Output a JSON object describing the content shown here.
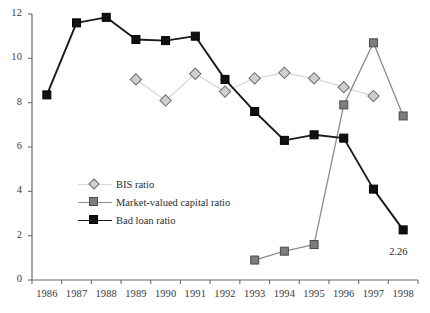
{
  "chart_data": {
    "type": "line",
    "title": "",
    "subtitle": "",
    "xlabel": "",
    "ylabel": "",
    "categories": [
      "1986",
      "1987",
      "1988",
      "1989",
      "1990",
      "1991",
      "1992",
      "1993",
      "1994",
      "1995",
      "1996",
      "1997",
      "1998"
    ],
    "x": [
      1986,
      1987,
      1988,
      1989,
      1990,
      1991,
      1992,
      1993,
      1994,
      1995,
      1996,
      1997,
      1998
    ],
    "xlim": [
      1985.5,
      1998.5
    ],
    "ylim": [
      0,
      12
    ],
    "yticks": [
      0,
      2,
      4,
      6,
      8,
      10,
      12
    ],
    "ytick_labels": [
      "0",
      "2",
      "4",
      "6",
      "8",
      "10",
      "12"
    ],
    "grid": false,
    "legend_position": "inside-lower-left",
    "series": [
      {
        "name": "BIS ratio",
        "color": "#d9d9d9",
        "marker": "diamond",
        "marker_fill": "#cfcfcf",
        "marker_edge": "#6e6e6e",
        "values": [
          null,
          null,
          null,
          9.05,
          8.1,
          9.3,
          8.5,
          9.1,
          9.35,
          9.1,
          8.7,
          8.3,
          null
        ]
      },
      {
        "name": "Market-valued capital ratio",
        "color": "#8c8c8c",
        "marker": "square",
        "marker_fill": "#7d7d7d",
        "marker_edge": "#4a4a4a",
        "values": [
          null,
          null,
          null,
          null,
          null,
          null,
          null,
          0.9,
          1.3,
          1.6,
          7.9,
          10.7,
          7.4
        ]
      },
      {
        "name": "Bad loan ratio",
        "color": "#1a1a1a",
        "marker": "square",
        "marker_fill": "#111111",
        "marker_edge": "#000000",
        "values": [
          8.35,
          11.6,
          11.85,
          10.85,
          10.8,
          11.0,
          9.05,
          7.6,
          6.3,
          6.55,
          6.4,
          4.1,
          2.26
        ]
      }
    ],
    "annotations": [
      {
        "text": "2.26",
        "x": 1998,
        "y": 2.26,
        "dx": 8,
        "dy": 16
      }
    ]
  },
  "legend": {
    "items": [
      {
        "label": "BIS ratio"
      },
      {
        "label": "Market-valued capital ratio"
      },
      {
        "label": "Bad loan ratio"
      }
    ]
  },
  "axes": {
    "y": {
      "labels": [
        "12",
        "10",
        "8",
        "6",
        "4",
        "2",
        "0"
      ]
    },
    "x": {
      "labels": [
        "1986",
        "1987",
        "1988",
        "1989",
        "1990",
        "1991",
        "1992",
        "1993",
        "1994",
        "1995",
        "1996",
        "1997",
        "1998"
      ]
    }
  }
}
